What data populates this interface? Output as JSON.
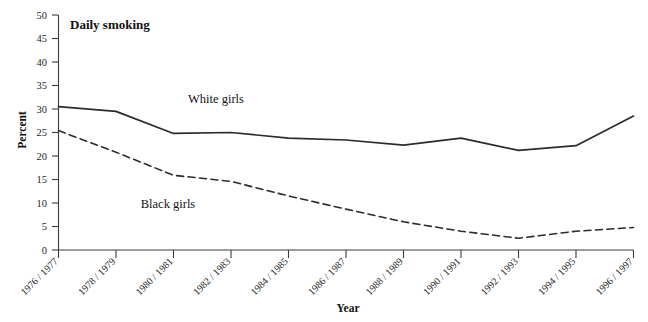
{
  "chart_data": {
    "type": "line",
    "title": "Daily smoking",
    "xlabel": "Year",
    "ylabel": "Percent",
    "categories": [
      "1976 / 1977",
      "1978 / 1979",
      "1980 / 1981",
      "1982 / 1983",
      "1984 / 1985",
      "1986 / 1987",
      "1988 / 1989",
      "1990 / 1991",
      "1992 / 1993",
      "1994 / 1995",
      "1996 / 1997"
    ],
    "ylim": [
      0,
      50
    ],
    "yticks": [
      0,
      5,
      10,
      15,
      20,
      25,
      30,
      35,
      40,
      45,
      50
    ],
    "grid": false,
    "legend_position": "inline-annotation",
    "series": [
      {
        "name": "White girls",
        "style": "solid",
        "color": "#2b2b2b",
        "values": [
          30.5,
          29.5,
          24.8,
          25.0,
          23.8,
          23.4,
          22.3,
          23.8,
          21.2,
          22.2,
          28.5
        ]
      },
      {
        "name": "Black girls",
        "style": "dashed",
        "color": "#2b2b2b",
        "values": [
          25.4,
          20.8,
          15.9,
          14.6,
          11.5,
          8.7,
          6.0,
          4.0,
          2.5,
          4.0,
          4.8
        ]
      }
    ],
    "annotations": [
      {
        "text": "White girls",
        "x": 216,
        "y": 103
      },
      {
        "text": "Black girls",
        "x": 168,
        "y": 208
      }
    ]
  },
  "axis": {
    "y_tick_labels": [
      "50",
      "45",
      "40",
      "35",
      "30",
      "25",
      "20",
      "15",
      "10",
      "5",
      "0"
    ]
  }
}
